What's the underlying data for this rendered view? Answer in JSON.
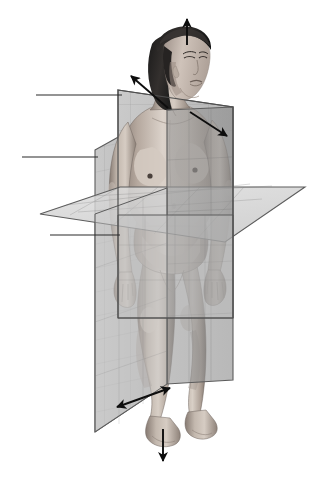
{
  "image": {
    "title": "Anatomical planes of the human body",
    "subject": "standing female figure in anatomical position",
    "background_color": "#ffffff",
    "width": 336,
    "height": 478,
    "style": "grayscale medical illustration"
  },
  "palette": {
    "plane_light": "#d6d6d6",
    "plane_mid": "#b9b9b9",
    "plane_dark": "#9a9a9a",
    "plane_darker": "#8e8e8e",
    "plane_edge": "#5a5a5a",
    "grid_line": "#7d7d7d",
    "arrow": "#0d0d0d",
    "leader_line": "#2b2b2b",
    "skin_light": "#d9cfc7",
    "skin_mid": "#b3a69c",
    "skin_shadow": "#8a7d74",
    "hair_dark": "#232323"
  },
  "planes": [
    {
      "id": "sagittal-plane",
      "name": "Sagittal (median) plane",
      "orientation": "vertical, divides body into left and right",
      "fill": "#c2c2c2"
    },
    {
      "id": "coronal-plane",
      "name": "Coronal (frontal) plane",
      "orientation": "vertical, divides body into front and back",
      "fill": "#9a9a9a"
    },
    {
      "id": "transverse-plane",
      "name": "Transverse (horizontal) plane",
      "orientation": "horizontal, divides body into upper and lower",
      "fill": "#d6d6d6"
    }
  ],
  "leader_lines": [
    {
      "id": "leader-line-top",
      "label": "",
      "y": 95,
      "x_start": 36,
      "x_end": 122
    },
    {
      "id": "leader-line-middle",
      "label": "",
      "y": 157,
      "x_start": 22,
      "x_end": 98
    },
    {
      "id": "leader-line-bottom",
      "label": "",
      "y": 235,
      "x_start": 50,
      "x_end": 120
    }
  ],
  "arrows": [
    {
      "id": "superior-arrow",
      "meaning": "superior / cranial direction",
      "type": "single-headed",
      "from": [
        187,
        45
      ],
      "to": [
        187,
        17
      ]
    },
    {
      "id": "left-lateral-arrow",
      "meaning": "left lateral direction",
      "type": "single-headed",
      "from": [
        168,
        108
      ],
      "to": [
        129,
        74
      ]
    },
    {
      "id": "right-lateral-arrow",
      "meaning": "right lateral direction",
      "type": "single-headed",
      "from": [
        190,
        112
      ],
      "to": [
        229,
        138
      ]
    },
    {
      "id": "anterior-posterior-arrow",
      "meaning": "anterior / posterior direction",
      "type": "double-headed",
      "from": [
        115,
        408
      ],
      "to": [
        172,
        387
      ]
    },
    {
      "id": "inferior-arrow",
      "meaning": "inferior / caudal direction",
      "type": "single-headed",
      "from": [
        163,
        429
      ],
      "to": [
        163,
        463
      ]
    }
  ],
  "body": {
    "pose": "standing, anatomical position, head turned to the figure's left",
    "regions": [
      "head",
      "hair",
      "neck",
      "torso",
      "arms",
      "hands",
      "pelvis",
      "legs",
      "feet"
    ]
  }
}
